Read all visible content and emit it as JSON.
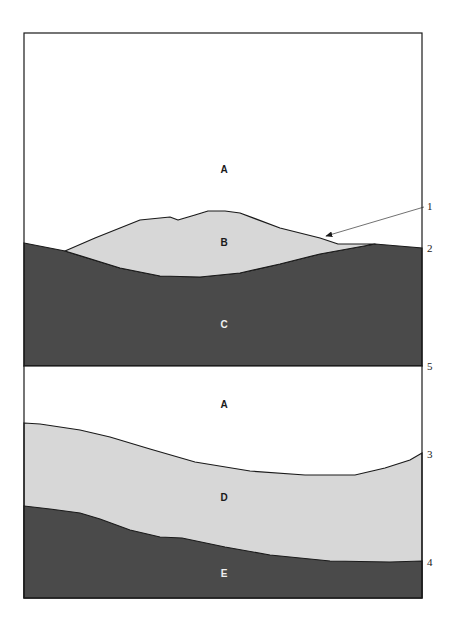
{
  "colors": {
    "background": "#ffffff",
    "outline": "#1a1a1a",
    "light_layer": "#d7d7d7",
    "dark_layer": "#4a4a4a",
    "label_on_light": "#1a1a1a",
    "label_on_dark": "#f0f0f0"
  },
  "top_panel": {
    "regions": {
      "A": "A",
      "B": "B",
      "C": "C"
    }
  },
  "bottom_panel": {
    "regions": {
      "A": "A",
      "D": "D",
      "E": "E"
    }
  },
  "callouts": {
    "c1": "1",
    "c2": "2",
    "c3": "3",
    "c4": "4",
    "c5": "5"
  }
}
